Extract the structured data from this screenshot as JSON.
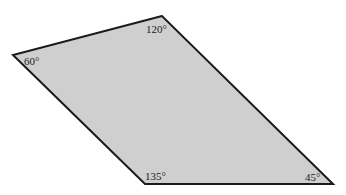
{
  "figure": {
    "shape": "quadrilateral",
    "fill_color": "#cfcfcf",
    "stroke_color": "#1a1a1a",
    "angles": {
      "top": "120°",
      "left": "60°",
      "bottom_left": "135°",
      "bottom_right": "45°"
    }
  }
}
